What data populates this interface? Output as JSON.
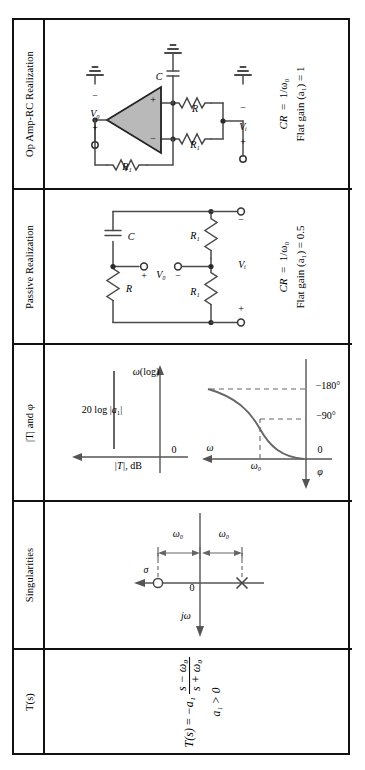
{
  "table": {
    "caption_rows": [
      "T(s)",
      "Singularities",
      "|T| and φ",
      "Passive Realization",
      "Op Amp-RC Realization"
    ],
    "row_labels": {
      "ts": "T(s)",
      "singularities": "Singularities",
      "magphase": "|T| and φ",
      "passive": "Passive Realization",
      "opamp": "Op Amp-RC Realization"
    }
  },
  "ts_row": {
    "label": "T(s)",
    "equation_lhs": "T(s)",
    "equals": "=",
    "leading": "−a₁",
    "numerator": "s − ω₀",
    "denominator": "s + ω₀",
    "condition": "a₁ > 0"
  },
  "singularities_row": {
    "label": "Singularities",
    "axis_vertical": "σ",
    "axis_horizontal": "jω",
    "origin": "0",
    "zero_distance": "ω₀",
    "pole_distance": "ω₀",
    "zero_marker": "zero-circle-marker",
    "pole_marker": "pole-cross-marker"
  },
  "magphase_row": {
    "label": "|T| and φ",
    "magnitude": {
      "y_axis": "|T|, dB",
      "x_axis": "ω(log)",
      "origin": "0",
      "flat_level": "20 log |a₁|"
    },
    "phase": {
      "y_axis": "ω",
      "x_axis": "φ",
      "origin": "0",
      "tick_omega0": "ω₀",
      "tick_m90": "−90°",
      "tick_m180": "−180°"
    }
  },
  "passive_row": {
    "label": "Passive Realization",
    "components": {
      "r_top": "R",
      "c_top": "C",
      "r1_left": "R₁",
      "r1_right": "R₁"
    },
    "ports": {
      "vin": "Vᵢ",
      "vin_plus": "+",
      "vin_minus": "−",
      "vout": "V₀",
      "vout_plus": "+",
      "vout_minus": "−"
    },
    "notes": [
      "CR = 1/ω₀",
      "Flat gain (a₁) = 0.5"
    ],
    "note_cr_lhs": "CR",
    "note_cr_rhs": "1/ω₀",
    "note_gain": "Flat gain (a₁) = 0.5"
  },
  "opamp_row": {
    "label": "Op Amp-RC Realization",
    "components": {
      "r1_feedback": "R₁",
      "r1_lower": "R₁",
      "r_lower": "R",
      "c": "C"
    },
    "opamp_terminals": {
      "inverting": "−",
      "noninverting": "+"
    },
    "ports": {
      "vout": "V₀",
      "vout_plus": "+",
      "vout_minus": "−",
      "vin": "Vᵢ",
      "vin_plus": "+",
      "vin_minus": "−"
    },
    "notes": [
      "CR = 1/ω₀",
      "Flat gain (a₁) = 1"
    ],
    "note_cr_lhs": "CR",
    "note_cr_rhs": "1/ω₀",
    "note_gain": "Flat gain (a₁) = 1"
  },
  "colors": {
    "ink": "#111111",
    "wire": "#4a4a4a",
    "opamp_fill": "#b9b9b9",
    "curve": "#555555"
  }
}
